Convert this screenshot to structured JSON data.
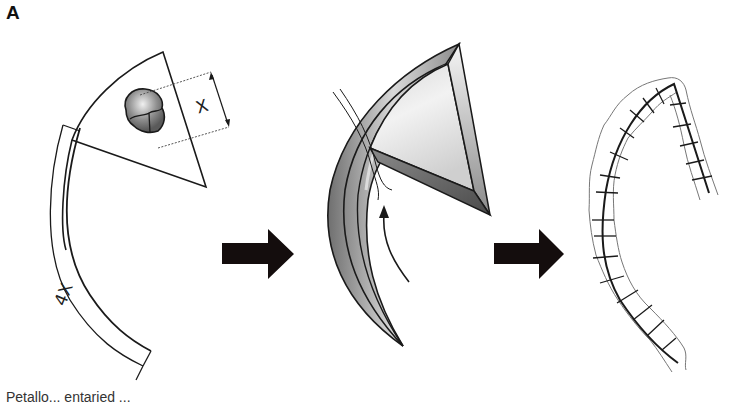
{
  "figure": {
    "panel_label": "A",
    "caption_partial": "Petalla ... entaried (clipped)",
    "caption_visible": "Petallo... entaried ..."
  },
  "step1": {
    "title": "flap-design",
    "dimension_width_label": "X",
    "dimension_length_label": "4X"
  },
  "step2": {
    "title": "flap-rotation"
  },
  "step3": {
    "title": "flap-sutured"
  },
  "colors": {
    "line": "#1a1a1a",
    "arrow_fill": "#140d0d",
    "tumor_gray": "#8a8a8a",
    "flap_light": "#e6e6e6",
    "flap_dark": "#6e6e6e",
    "suture_gray": "#7a7a7a"
  }
}
